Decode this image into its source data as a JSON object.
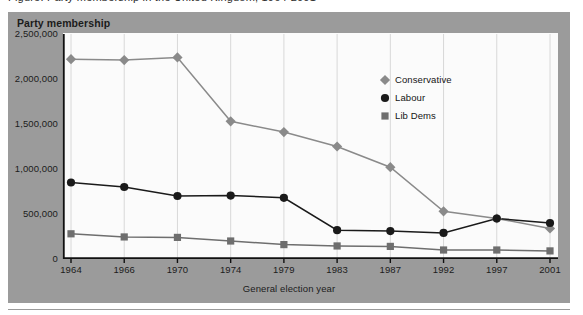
{
  "top_caption": "Figure: Party membership in the United Kingdom, 1964-2001",
  "figure": {
    "y_axis_title": "Party membership",
    "x_axis_title": "General election year",
    "panel_color": "#9b9b9b",
    "plot_background": "#fbfbfb"
  },
  "legend": {
    "position": "inside-right",
    "entries": [
      {
        "label": "Conservative",
        "marker": "diamond",
        "color": "#8a8a8a"
      },
      {
        "label": "Labour",
        "marker": "circle",
        "color": "#1a1a1a"
      },
      {
        "label": "Lib Dems",
        "marker": "square",
        "color": "#6e6e6e"
      }
    ]
  },
  "chart_data": {
    "type": "line",
    "title": "Party membership",
    "xlabel": "General election year",
    "ylabel": "Party membership",
    "categories": [
      "1964",
      "1966",
      "1970",
      "1974",
      "1979",
      "1983",
      "1987",
      "1992",
      "1997",
      "2001"
    ],
    "ylim": [
      0,
      2500000
    ],
    "yticks": [
      0,
      500000,
      1000000,
      1500000,
      2000000,
      2500000
    ],
    "ytick_labels": [
      "0",
      "500,000",
      "1,000,000",
      "1,500,000",
      "2,000,000",
      "2,500,000"
    ],
    "grid": "vertical",
    "legend_position": "inside-right",
    "series": [
      {
        "name": "Conservative",
        "marker": "diamond",
        "color": "#8a8a8a",
        "values": [
          2220000,
          2210000,
          2240000,
          1530000,
          1410000,
          1250000,
          1020000,
          530000,
          450000,
          340000
        ]
      },
      {
        "name": "Labour",
        "marker": "circle",
        "color": "#1a1a1a",
        "values": [
          850000,
          800000,
          700000,
          705000,
          680000,
          320000,
          310000,
          290000,
          450000,
          400000
        ]
      },
      {
        "name": "Lib Dems",
        "marker": "square",
        "color": "#6e6e6e",
        "values": [
          280000,
          245000,
          240000,
          200000,
          160000,
          145000,
          140000,
          100000,
          100000,
          90000
        ]
      }
    ]
  }
}
